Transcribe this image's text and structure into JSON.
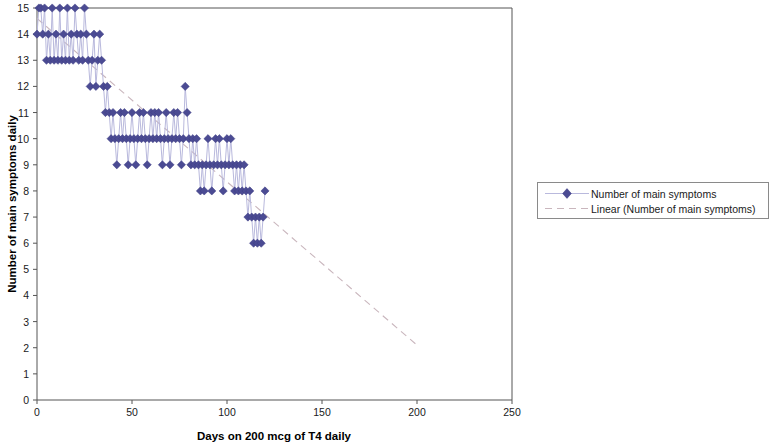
{
  "chart_data": {
    "type": "scatter",
    "title": "",
    "xlabel": "Days on 200 mcg of T4 daily",
    "ylabel": "Number of main symptoms daily",
    "xlim": [
      0,
      250
    ],
    "ylim": [
      0,
      15
    ],
    "xticks": [
      0,
      50,
      100,
      150,
      200,
      250
    ],
    "yticks": [
      0,
      1,
      2,
      3,
      4,
      5,
      6,
      7,
      8,
      9,
      10,
      11,
      12,
      13,
      14,
      15
    ],
    "grid": false,
    "legend_position": "right",
    "marker_color": "#4b4b93",
    "line_color": "#b9b9dd",
    "trendline_color": "#c9b6bd",
    "series": [
      {
        "name": "Number of main symptoms",
        "marker": "diamond",
        "x": [
          0,
          1,
          2,
          3,
          4,
          5,
          6,
          7,
          8,
          9,
          10,
          11,
          12,
          13,
          14,
          15,
          16,
          17,
          18,
          19,
          20,
          21,
          22,
          23,
          24,
          25,
          26,
          27,
          28,
          29,
          30,
          31,
          32,
          33,
          34,
          35,
          36,
          37,
          38,
          39,
          40,
          41,
          42,
          43,
          44,
          45,
          46,
          47,
          48,
          49,
          50,
          51,
          52,
          53,
          54,
          55,
          56,
          57,
          58,
          59,
          60,
          61,
          62,
          63,
          64,
          65,
          66,
          67,
          68,
          69,
          70,
          71,
          72,
          73,
          74,
          75,
          76,
          77,
          78,
          79,
          80,
          81,
          82,
          83,
          84,
          85,
          86,
          87,
          88,
          89,
          90,
          91,
          92,
          93,
          94,
          95,
          96,
          97,
          98,
          99,
          100,
          101,
          102,
          103,
          104,
          105,
          106,
          107,
          108,
          109,
          110,
          111,
          112,
          113,
          114,
          115,
          116,
          117,
          118,
          119,
          120
        ],
        "y": [
          14,
          15,
          15,
          14,
          15,
          13,
          14,
          13,
          15,
          13,
          14,
          13,
          15,
          13,
          14,
          13,
          15,
          13,
          14,
          13,
          15,
          14,
          13,
          14,
          13,
          15,
          14,
          13,
          12,
          13,
          14,
          12,
          13,
          14,
          13,
          12,
          11,
          12,
          11,
          10,
          11,
          10,
          9,
          10,
          11,
          10,
          11,
          10,
          9,
          10,
          11,
          10,
          9,
          10,
          11,
          10,
          11,
          10,
          9,
          10,
          11,
          10,
          11,
          10,
          11,
          10,
          9,
          10,
          11,
          10,
          9,
          10,
          11,
          10,
          11,
          10,
          9,
          10,
          12,
          11,
          10,
          9,
          10,
          9,
          10,
          9,
          8,
          9,
          8,
          9,
          10,
          9,
          8,
          9,
          10,
          9,
          10,
          9,
          8,
          9,
          10,
          9,
          10,
          9,
          8,
          9,
          8,
          9,
          8,
          9,
          8,
          7,
          8,
          7,
          6,
          7,
          6,
          7,
          6,
          7,
          8
        ]
      }
    ],
    "trendline": {
      "name": "Linear (Number of main symptoms)",
      "style": "dashed",
      "x": [
        0,
        200
      ],
      "y": [
        14.6,
        2.1
      ]
    },
    "legend": [
      {
        "label": "Number of main symptoms",
        "type": "marker-line"
      },
      {
        "label": "Linear (Number of main symptoms)",
        "type": "dashed-line"
      }
    ]
  }
}
